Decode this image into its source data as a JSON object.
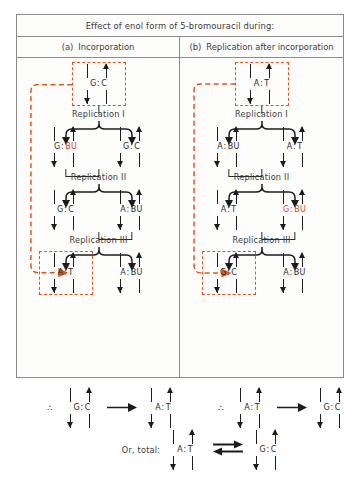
{
  "figure": {
    "title": "Effect of enol form of 5-bromouracil during:",
    "columns": [
      {
        "tag": "(a)",
        "label": "Incorporation"
      },
      {
        "tag": "(b)",
        "label": "Replication after incorporation"
      }
    ]
  },
  "colors": {
    "accent_orange": "#e0561f",
    "mutant_red": "#d2401e",
    "ink": "#1c1c1c",
    "frame": "#8b8b8b"
  },
  "panel_a": {
    "name": "incorporation",
    "start": {
      "left": "G",
      "sep": ":",
      "right": "C",
      "boxed": true,
      "right_red": false
    },
    "steps": [
      {
        "label": "Replication I"
      },
      {
        "label": "Replication II"
      },
      {
        "label": "Replication III"
      }
    ],
    "generation1": [
      {
        "left": "G",
        "sep": ":",
        "right": "BU",
        "right_red": true
      },
      {
        "left": "G",
        "sep": ":",
        "right": "C",
        "right_red": false
      }
    ],
    "generation2": [
      {
        "left": "G",
        "sep": ":",
        "right": "C",
        "right_red": false
      },
      {
        "left": "A",
        "sep": ":",
        "right": "BU",
        "right_red": false
      }
    ],
    "generation3": [
      {
        "left": "A",
        "sep": ":",
        "right": "T",
        "right_red": false,
        "boxed": true
      },
      {
        "left": "A",
        "sep": ":",
        "right": "BU",
        "right_red": false
      }
    ]
  },
  "panel_b": {
    "name": "replication-after-incorporation",
    "start": {
      "left": "A",
      "sep": ":",
      "right": "T",
      "boxed": true,
      "right_red": false
    },
    "steps": [
      {
        "label": "Replication I"
      },
      {
        "label": "Replication II"
      },
      {
        "label": "Replication III"
      }
    ],
    "generation1": [
      {
        "left": "A",
        "sep": ":",
        "right": "BU",
        "right_red": false
      },
      {
        "left": "A",
        "sep": ":",
        "right": "T",
        "right_red": false
      }
    ],
    "generation2": [
      {
        "left": "A",
        "sep": ":",
        "right": "T",
        "right_red": false
      },
      {
        "left": "G",
        "sep": ":",
        "right": "BU",
        "right_red": true,
        "all_red": true
      }
    ],
    "generation3": [
      {
        "left": "G",
        "sep": ":",
        "right": "C",
        "right_red": false,
        "boxed": true
      },
      {
        "left": "A",
        "sep": ":",
        "right": "BU",
        "right_red": false
      }
    ]
  },
  "summary": {
    "therefore_symbol": "∴",
    "left_conclusion": {
      "from": {
        "left": "G",
        "sep": ":",
        "right": "C"
      },
      "to": {
        "left": "A",
        "sep": ":",
        "right": "T"
      }
    },
    "right_conclusion": {
      "from": {
        "left": "A",
        "sep": ":",
        "right": "T"
      },
      "to": {
        "left": "G",
        "sep": ":",
        "right": "C"
      }
    },
    "total_label": "Or, total:",
    "total": {
      "from": {
        "left": "A",
        "sep": ":",
        "right": "T"
      },
      "to": {
        "left": "G",
        "sep": ":",
        "right": "C"
      },
      "relation": "equilibrium"
    }
  }
}
